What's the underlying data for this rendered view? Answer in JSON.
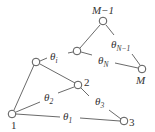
{
  "diagram": {
    "type": "graph",
    "nodes": [
      {
        "id": "n1",
        "label": "1",
        "x": 12,
        "y": 114
      },
      {
        "id": "n2",
        "label": "2",
        "x": 78,
        "y": 85
      },
      {
        "id": "n3",
        "label": "3",
        "x": 124,
        "y": 121
      },
      {
        "id": "nA",
        "label": "",
        "x": 36,
        "y": 62
      },
      {
        "id": "nB",
        "label": "",
        "x": 77,
        "y": 51
      },
      {
        "id": "nM1",
        "label": "M−1",
        "x": 103,
        "y": 21
      },
      {
        "id": "nM",
        "label": "M",
        "x": 142,
        "y": 69
      }
    ],
    "angles": {
      "theta_1": {
        "base": "θ",
        "sub": "1"
      },
      "theta_2": {
        "base": "θ",
        "sub": "2"
      },
      "theta_3": {
        "base": "θ",
        "sub": "3"
      },
      "theta_i": {
        "base": "θ",
        "sub": "i"
      },
      "theta_N": {
        "base": "θ",
        "sub": "N"
      },
      "theta_N1": {
        "base": "θ",
        "sub": "N−1"
      }
    },
    "edges": [
      {
        "from": "nM1",
        "to": "nB"
      },
      {
        "from": "nM1",
        "to": "nM",
        "label": "theta_N1"
      },
      {
        "from": "nB",
        "to": "nM",
        "label": "theta_N"
      },
      {
        "from": "nA",
        "to": "nB",
        "label": "theta_i"
      },
      {
        "from": "nA",
        "to": "n2"
      },
      {
        "from": "nA",
        "to": "n1"
      },
      {
        "from": "n1",
        "to": "n2",
        "label": "theta_2"
      },
      {
        "from": "n2",
        "to": "n3",
        "label": "theta_3"
      },
      {
        "from": "n1",
        "to": "n3",
        "label": "theta_1"
      }
    ]
  }
}
